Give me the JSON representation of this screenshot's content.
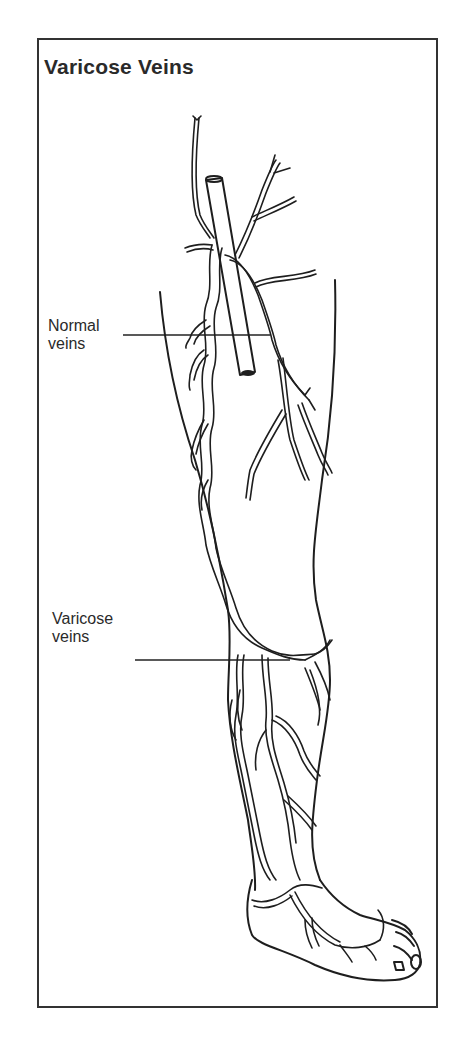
{
  "figure": {
    "title": "Varicose Veins",
    "labels": {
      "normal_line1": "Normal",
      "normal_line2": "veins",
      "varicose_line1": "Varicose",
      "varicose_line2": "veins"
    },
    "colors": {
      "line": "#1e1e1e",
      "frame": "#333333",
      "background": "#ffffff"
    }
  }
}
